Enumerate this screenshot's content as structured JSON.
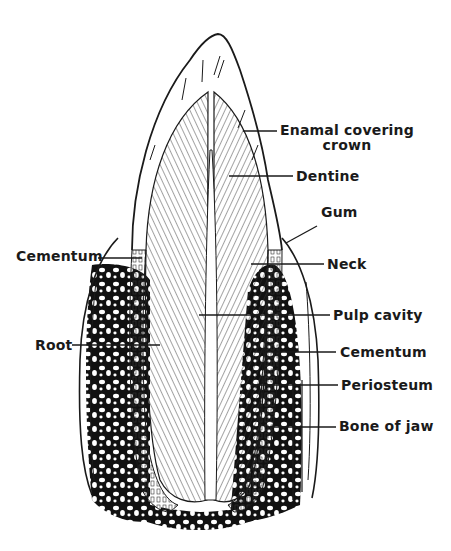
{
  "diagram": {
    "colors": {
      "ink": "#1a1a1a",
      "paper": "#ffffff",
      "bone": "#111111"
    },
    "labels": [
      {
        "id": "enamel",
        "text": "Enamal covering",
        "text2": "crown"
      },
      {
        "id": "dentine",
        "text": "Dentine"
      },
      {
        "id": "gum",
        "text": "Gum"
      },
      {
        "id": "cementum-left",
        "text": "Cementum"
      },
      {
        "id": "neck",
        "text": "Neck"
      },
      {
        "id": "pulp-cavity",
        "text": "Pulp cavity"
      },
      {
        "id": "root",
        "text": "Root"
      },
      {
        "id": "cementum-right",
        "text": "Cementum"
      },
      {
        "id": "periosteum",
        "text": "Periosteum"
      },
      {
        "id": "bone-of-jaw",
        "text": "Bone of jaw"
      }
    ]
  }
}
